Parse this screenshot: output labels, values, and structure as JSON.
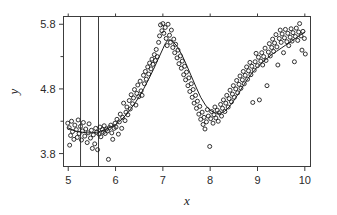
{
  "chart_data": {
    "type": "scatter",
    "title": "",
    "xlabel": "x",
    "ylabel": "y",
    "xlim": [
      4.9,
      10.12
    ],
    "ylim": [
      3.6,
      5.92
    ],
    "xticks": [
      5,
      6,
      7,
      8,
      9,
      10
    ],
    "xtick_labels": [
      "5",
      "6",
      "7",
      "8",
      "9",
      "10"
    ],
    "yticks": [
      3.8,
      4.8,
      5.8
    ],
    "ytick_labels": [
      "3.8",
      "4.8",
      "5.8"
    ],
    "grid": false,
    "legend": null,
    "marker": "open-circle",
    "point_color": "#1c1c1c",
    "curve_color": "#1c1c1c",
    "frame_color": "#3c3c3c",
    "background": "#ffffff",
    "annotations": [
      {
        "type": "vertical-line",
        "x": 5.26,
        "label": ""
      },
      {
        "type": "vertical-line",
        "x": 5.64,
        "label": ""
      }
    ],
    "series": [
      {
        "name": "observations",
        "type": "scatter",
        "points": [
          [
            4.99,
            4.27
          ],
          [
            5.02,
            4.2
          ],
          [
            5.03,
            3.93
          ],
          [
            5.05,
            4.08
          ],
          [
            5.07,
            4.3
          ],
          [
            5.09,
            4.14
          ],
          [
            5.12,
            4.02
          ],
          [
            5.14,
            4.24
          ],
          [
            5.17,
            4.17
          ],
          [
            5.19,
            4.05
          ],
          [
            5.21,
            4.32
          ],
          [
            5.23,
            4.11
          ],
          [
            5.26,
            4.22
          ],
          [
            5.28,
            4.01
          ],
          [
            5.3,
            4.15
          ],
          [
            5.32,
            4.28
          ],
          [
            5.35,
            4.07
          ],
          [
            5.37,
            4.18
          ],
          [
            5.4,
            3.97
          ],
          [
            5.42,
            4.12
          ],
          [
            5.44,
            4.26
          ],
          [
            5.47,
            4.04
          ],
          [
            5.49,
            4.16
          ],
          [
            5.51,
            3.88
          ],
          [
            5.53,
            4.09
          ],
          [
            5.56,
            3.95
          ],
          [
            5.58,
            4.19
          ],
          [
            5.6,
            4.13
          ],
          [
            5.62,
            3.86
          ],
          [
            5.65,
            4.1
          ],
          [
            5.67,
            4.21
          ],
          [
            5.69,
            4.06
          ],
          [
            5.72,
            4.17
          ],
          [
            5.74,
            4.13
          ],
          [
            5.76,
            4.23
          ],
          [
            5.78,
            4.11
          ],
          [
            5.81,
            4.18
          ],
          [
            5.83,
            4.15
          ],
          [
            5.85,
            3.71
          ],
          [
            5.87,
            4.2
          ],
          [
            5.9,
            4.24
          ],
          [
            5.92,
            4.12
          ],
          [
            5.94,
            4.02
          ],
          [
            5.97,
            4.19
          ],
          [
            5.99,
            4.27
          ],
          [
            6.01,
            4.21
          ],
          [
            6.03,
            4.33
          ],
          [
            6.06,
            4.1
          ],
          [
            6.08,
            4.29
          ],
          [
            6.1,
            4.41
          ],
          [
            6.13,
            4.19
          ],
          [
            6.15,
            4.36
          ],
          [
            6.17,
            4.58
          ],
          [
            6.2,
            4.31
          ],
          [
            6.22,
            4.44
          ],
          [
            6.24,
            4.52
          ],
          [
            6.26,
            4.4
          ],
          [
            6.29,
            4.62
          ],
          [
            6.31,
            4.49
          ],
          [
            6.33,
            4.71
          ],
          [
            6.36,
            4.57
          ],
          [
            6.38,
            4.66
          ],
          [
            6.4,
            4.79
          ],
          [
            6.43,
            4.55
          ],
          [
            6.45,
            4.73
          ],
          [
            6.47,
            4.86
          ],
          [
            6.49,
            4.68
          ],
          [
            6.52,
            4.92
          ],
          [
            6.54,
            4.77
          ],
          [
            6.56,
            4.7
          ],
          [
            6.59,
            5.01
          ],
          [
            6.61,
            4.88
          ],
          [
            6.63,
            5.07
          ],
          [
            6.65,
            4.95
          ],
          [
            6.68,
            5.14
          ],
          [
            6.7,
            5.03
          ],
          [
            6.72,
            5.2
          ],
          [
            6.75,
            5.11
          ],
          [
            6.77,
            5.26
          ],
          [
            6.79,
            5.18
          ],
          [
            6.82,
            5.33
          ],
          [
            6.84,
            5.24
          ],
          [
            6.86,
            5.41
          ],
          [
            6.88,
            5.3
          ],
          [
            6.91,
            5.52
          ],
          [
            6.93,
            5.62
          ],
          [
            6.95,
            5.79
          ],
          [
            6.98,
            5.7
          ],
          [
            7.0,
            5.81
          ],
          [
            7.02,
            5.66
          ],
          [
            7.05,
            5.75
          ],
          [
            7.07,
            5.58
          ],
          [
            7.09,
            5.47
          ],
          [
            7.11,
            5.8
          ],
          [
            7.14,
            5.63
          ],
          [
            7.16,
            5.52
          ],
          [
            7.18,
            5.71
          ],
          [
            7.21,
            5.44
          ],
          [
            7.23,
            5.57
          ],
          [
            7.25,
            5.36
          ],
          [
            7.27,
            5.49
          ],
          [
            7.3,
            5.28
          ],
          [
            7.32,
            5.4
          ],
          [
            7.34,
            5.19
          ],
          [
            7.37,
            5.31
          ],
          [
            7.39,
            5.12
          ],
          [
            7.41,
            5.23
          ],
          [
            7.44,
            5.02
          ],
          [
            7.46,
            5.15
          ],
          [
            7.48,
            4.94
          ],
          [
            7.5,
            5.06
          ],
          [
            7.53,
            4.85
          ],
          [
            7.55,
            4.97
          ],
          [
            7.57,
            4.76
          ],
          [
            7.6,
            4.88
          ],
          [
            7.62,
            4.67
          ],
          [
            7.64,
            4.79
          ],
          [
            7.66,
            4.58
          ],
          [
            7.69,
            4.7
          ],
          [
            7.71,
            4.5
          ],
          [
            7.73,
            4.61
          ],
          [
            7.76,
            4.41
          ],
          [
            7.78,
            4.53
          ],
          [
            7.8,
            4.33
          ],
          [
            7.83,
            4.44
          ],
          [
            7.85,
            4.25
          ],
          [
            7.87,
            4.36
          ],
          [
            7.89,
            4.18
          ],
          [
            7.92,
            4.29
          ],
          [
            7.94,
            4.48
          ],
          [
            7.96,
            4.38
          ],
          [
            7.99,
            3.91
          ],
          [
            8.01,
            4.34
          ],
          [
            8.03,
            4.45
          ],
          [
            8.06,
            4.27
          ],
          [
            8.08,
            4.4
          ],
          [
            8.1,
            4.52
          ],
          [
            8.12,
            4.35
          ],
          [
            8.15,
            4.47
          ],
          [
            8.17,
            4.3
          ],
          [
            8.19,
            4.43
          ],
          [
            8.22,
            4.56
          ],
          [
            8.24,
            4.38
          ],
          [
            8.26,
            4.5
          ],
          [
            8.28,
            4.63
          ],
          [
            8.31,
            4.45
          ],
          [
            8.33,
            4.58
          ],
          [
            8.35,
            4.7
          ],
          [
            8.38,
            4.52
          ],
          [
            8.4,
            4.65
          ],
          [
            8.42,
            4.78
          ],
          [
            8.45,
            4.6
          ],
          [
            8.47,
            4.72
          ],
          [
            8.49,
            4.85
          ],
          [
            8.51,
            4.67
          ],
          [
            8.54,
            4.8
          ],
          [
            8.56,
            4.93
          ],
          [
            8.58,
            4.74
          ],
          [
            8.61,
            4.87
          ],
          [
            8.63,
            5.0
          ],
          [
            8.65,
            4.81
          ],
          [
            8.68,
            4.94
          ],
          [
            8.7,
            5.07
          ],
          [
            8.72,
            4.88
          ],
          [
            8.74,
            5.01
          ],
          [
            8.77,
            5.14
          ],
          [
            8.79,
            4.95
          ],
          [
            8.81,
            5.08
          ],
          [
            8.84,
            5.21
          ],
          [
            8.86,
            5.02
          ],
          [
            8.88,
            5.15
          ],
          [
            8.9,
            4.59
          ],
          [
            8.93,
            5.09
          ],
          [
            8.95,
            5.22
          ],
          [
            8.97,
            5.35
          ],
          [
            9.0,
            5.16
          ],
          [
            9.02,
            5.29
          ],
          [
            9.04,
            4.63
          ],
          [
            9.07,
            5.23
          ],
          [
            9.09,
            5.36
          ],
          [
            9.11,
            5.17
          ],
          [
            9.13,
            5.3
          ],
          [
            9.16,
            5.43
          ],
          [
            9.18,
            5.24
          ],
          [
            9.2,
            4.85
          ],
          [
            9.23,
            5.37
          ],
          [
            9.25,
            5.5
          ],
          [
            9.27,
            5.31
          ],
          [
            9.3,
            5.44
          ],
          [
            9.32,
            5.57
          ],
          [
            9.34,
            5.38
          ],
          [
            9.36,
            5.51
          ],
          [
            9.39,
            5.64
          ],
          [
            9.41,
            5.45
          ],
          [
            9.43,
            5.17
          ],
          [
            9.46,
            5.58
          ],
          [
            9.48,
            5.71
          ],
          [
            9.5,
            5.52
          ],
          [
            9.52,
            5.65
          ],
          [
            9.55,
            5.36
          ],
          [
            9.57,
            5.59
          ],
          [
            9.59,
            5.72
          ],
          [
            9.62,
            5.53
          ],
          [
            9.64,
            5.66
          ],
          [
            9.66,
            5.47
          ],
          [
            9.69,
            5.6
          ],
          [
            9.71,
            5.73
          ],
          [
            9.73,
            5.54
          ],
          [
            9.75,
            5.67
          ],
          [
            9.78,
            5.22
          ],
          [
            9.8,
            5.61
          ],
          [
            9.82,
            5.74
          ],
          [
            9.85,
            5.55
          ],
          [
            9.87,
            5.68
          ],
          [
            9.89,
            5.81
          ],
          [
            9.92,
            5.62
          ],
          [
            9.94,
            5.4
          ],
          [
            9.96,
            5.69
          ],
          [
            9.99,
            5.58
          ],
          [
            10.01,
            5.34
          ]
        ]
      },
      {
        "name": "smooth-fit",
        "type": "line",
        "points": [
          [
            4.99,
            4.2
          ],
          [
            5.1,
            4.16
          ],
          [
            5.2,
            4.14
          ],
          [
            5.3,
            4.13
          ],
          [
            5.4,
            4.12
          ],
          [
            5.5,
            4.12
          ],
          [
            5.6,
            4.13
          ],
          [
            5.7,
            4.15
          ],
          [
            5.8,
            4.18
          ],
          [
            5.9,
            4.21
          ],
          [
            6.0,
            4.25
          ],
          [
            6.1,
            4.31
          ],
          [
            6.2,
            4.38
          ],
          [
            6.3,
            4.47
          ],
          [
            6.4,
            4.57
          ],
          [
            6.5,
            4.68
          ],
          [
            6.6,
            4.81
          ],
          [
            6.7,
            4.95
          ],
          [
            6.8,
            5.1
          ],
          [
            6.9,
            5.26
          ],
          [
            7.0,
            5.42
          ],
          [
            7.05,
            5.5
          ],
          [
            7.1,
            5.55
          ],
          [
            7.15,
            5.56
          ],
          [
            7.2,
            5.54
          ],
          [
            7.3,
            5.46
          ],
          [
            7.4,
            5.33
          ],
          [
            7.5,
            5.17
          ],
          [
            7.6,
            5.0
          ],
          [
            7.7,
            4.83
          ],
          [
            7.8,
            4.67
          ],
          [
            7.9,
            4.55
          ],
          [
            8.0,
            4.47
          ],
          [
            8.1,
            4.43
          ],
          [
            8.2,
            4.42
          ],
          [
            8.3,
            4.45
          ],
          [
            8.4,
            4.52
          ],
          [
            8.5,
            4.62
          ],
          [
            8.6,
            4.73
          ],
          [
            8.7,
            4.85
          ],
          [
            8.8,
            4.96
          ],
          [
            8.9,
            5.06
          ],
          [
            9.0,
            5.14
          ],
          [
            9.1,
            5.21
          ],
          [
            9.2,
            5.27
          ],
          [
            9.3,
            5.33
          ],
          [
            9.4,
            5.38
          ],
          [
            9.5,
            5.43
          ],
          [
            9.6,
            5.48
          ],
          [
            9.7,
            5.53
          ],
          [
            9.8,
            5.58
          ],
          [
            9.9,
            5.63
          ],
          [
            10.0,
            5.68
          ]
        ]
      }
    ]
  }
}
